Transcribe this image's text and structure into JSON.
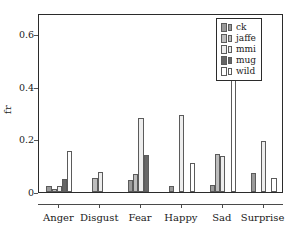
{
  "chart_data": {
    "type": "bar",
    "title": "",
    "xlabel": "",
    "ylabel": "fr",
    "categories": [
      "Anger",
      "Disgust",
      "Fear",
      "Happy",
      "Sad",
      "Surprise"
    ],
    "ylim": [
      0,
      0.68
    ],
    "yticks": [
      0,
      0.2,
      0.4,
      0.6
    ],
    "ytick_labels": [
      "0",
      "0.2",
      "0.4",
      "0.6"
    ],
    "grid": false,
    "legend_position": "upper right",
    "series": [
      {
        "name": "ck",
        "color": "#9a9a9a",
        "values": [
          0.023,
          0.0,
          0.045,
          0.022,
          0.028,
          0.074
        ]
      },
      {
        "name": "jaffe",
        "color": "#bdbdbd",
        "values": [
          0.012,
          0.053,
          0.07,
          0.0,
          0.143,
          0.0
        ]
      },
      {
        "name": "mmi",
        "color": "#ededed",
        "values": [
          0.024,
          0.075,
          0.28,
          0.293,
          0.135,
          0.194
        ]
      },
      {
        "name": "mug",
        "color": "#666666",
        "values": [
          0.05,
          0.0,
          0.142,
          0.0,
          0.0,
          0.0
        ]
      },
      {
        "name": "wild",
        "color": "#ffffff",
        "values": [
          0.157,
          0.0,
          0.0,
          0.11,
          0.615,
          0.055
        ]
      }
    ]
  },
  "legend": {
    "items": [
      {
        "label": "ck"
      },
      {
        "label": "jaffe"
      },
      {
        "label": "mmi"
      },
      {
        "label": "mug"
      },
      {
        "label": "wild"
      }
    ]
  }
}
